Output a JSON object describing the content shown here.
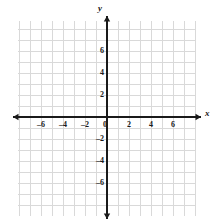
{
  "chart_data": {
    "type": "scatter",
    "title": "",
    "subtitle": "",
    "xlabel": "x",
    "ylabel": "y",
    "xlim": [
      -8,
      8
    ],
    "ylim": [
      -8,
      8
    ],
    "x_ticks": [
      -6,
      -4,
      -2,
      0,
      2,
      4,
      6
    ],
    "y_ticks": [
      -6,
      -4,
      -2,
      2,
      4,
      6
    ],
    "x_tick_labels": [
      "–6",
      "–4",
      "–2",
      "0",
      "2",
      "4",
      "6"
    ],
    "y_tick_labels": [
      "–6",
      "–4",
      "–2",
      "2",
      "4",
      "6"
    ],
    "origin_label": "0",
    "grid": true,
    "grid_step": 1,
    "minor_grid": true,
    "legend": "none",
    "series": [
      {
        "name": "points",
        "points": []
      }
    ],
    "annotations": [],
    "axis_arrows": [
      "left",
      "right",
      "up",
      "down"
    ],
    "colors": {
      "background": "#ffffff",
      "grid_line": "#d9d9d9",
      "grid_line_minor": "#ececec",
      "axis": "#1a1a1a",
      "label_text": "#1a1a1a"
    }
  },
  "geometry": {
    "origin_x": 107,
    "origin_y": 117,
    "unit_px": 11,
    "grid_left": 18,
    "grid_right": 196,
    "grid_top": 21,
    "grid_bottom": 216
  }
}
